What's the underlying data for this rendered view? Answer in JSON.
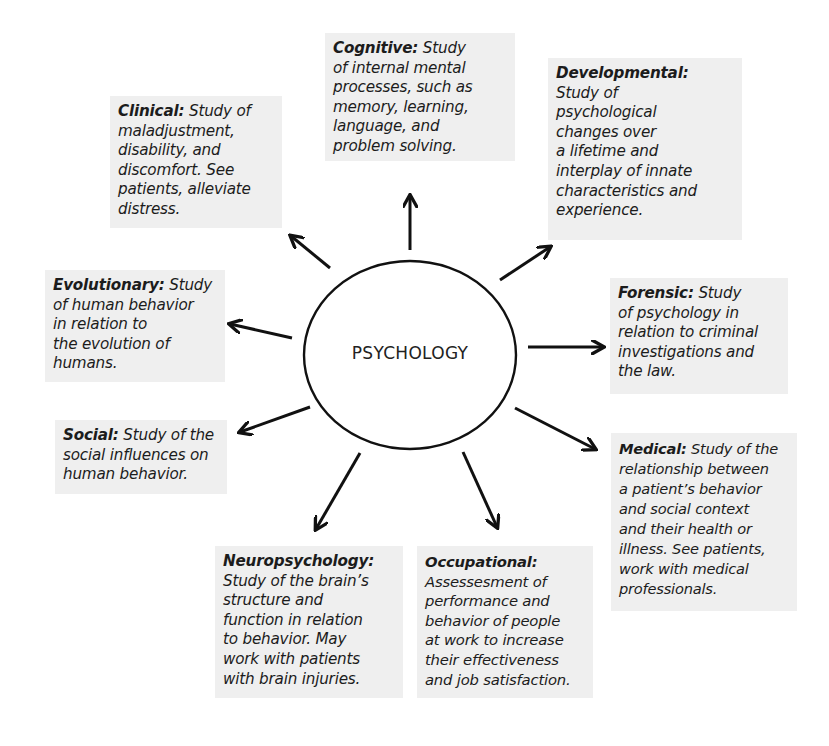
{
  "center": {
    "label": "PSYCHOLOGY"
  },
  "branches": [
    {
      "id": "cognitive",
      "term": "Cognitive:",
      "lines": [
        " Study",
        "of internal mental",
        "processes, such as",
        "memory, learning,",
        "language, and",
        "problem solving."
      ]
    },
    {
      "id": "clinical",
      "term": "Clinical:",
      "lines": [
        " Study of",
        "maladjustment,",
        "disability, and",
        "discomfort. See",
        "patients, alleviate",
        "distress."
      ]
    },
    {
      "id": "developmental",
      "term": "Developmental:",
      "lines": [
        "",
        "Study of",
        "psychological",
        "changes over",
        "a lifetime and",
        "interplay of innate",
        "characteristics and",
        "experience."
      ]
    },
    {
      "id": "evolutionary",
      "term": "Evolutionary:",
      "lines": [
        " Study",
        "of human behavior",
        "in relation to",
        "the evolution of",
        "humans."
      ]
    },
    {
      "id": "forensic",
      "term": "Forensic:",
      "lines": [
        " Study",
        "of psychology in",
        "relation to criminal",
        "investigations and",
        "the law."
      ]
    },
    {
      "id": "social",
      "term": "Social:",
      "lines": [
        " Study of the",
        "social influences on",
        "human behavior."
      ]
    },
    {
      "id": "medical",
      "term": "Medical:",
      "lines": [
        " Study of the",
        "relationship between",
        "a patient’s behavior",
        "and social context",
        "and their health or",
        "illness. See patients,",
        "work with medical",
        "professionals."
      ]
    },
    {
      "id": "neuropsychology",
      "term": "Neuropsychology:",
      "lines": [
        "",
        "Study of the brain’s",
        "structure and",
        "function in relation",
        "to behavior. May",
        "work with patients",
        "with brain injuries."
      ]
    },
    {
      "id": "occupational",
      "term": "Occupational:",
      "lines": [
        "",
        "Assessesment of",
        "performance and",
        "behavior of people",
        "at work to increase",
        "their effectiveness",
        "and job satisfaction."
      ]
    }
  ],
  "colors": {
    "box_background": "#efefef",
    "arrow": "#111111",
    "text": "#1c1c1c"
  }
}
